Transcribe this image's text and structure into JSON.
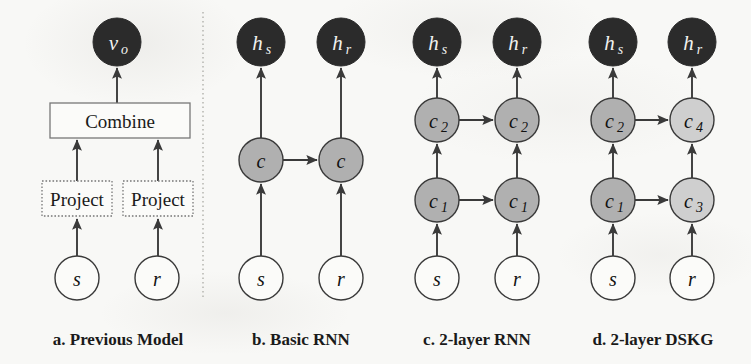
{
  "figure": {
    "background_color": "#f8f8f6",
    "divider": {
      "name": "panel-divider",
      "style": "dotted-vertical",
      "color": "#b9b9b4"
    }
  },
  "colors": {
    "node_dark": "#2b2b2b",
    "node_mid_gray": "#b0b0b0",
    "node_light_gray": "#cfcfcf",
    "node_white": "#fbfbf9",
    "stroke": "#3a3a3a",
    "box_border": "#777777",
    "text_dark": "#1a1a1a",
    "text_on_dark": "#f2f2f0"
  },
  "panels": [
    {
      "id": "panel-a",
      "caption": "a. Previous Model",
      "caption_x": 118,
      "nodes": [
        {
          "name": "node-vo",
          "label": "v",
          "sub": "o",
          "x": 117,
          "y": 42,
          "r": 24,
          "fill": "node_dark",
          "text": "light"
        },
        {
          "name": "node-s",
          "label": "s",
          "sub": "",
          "x": 77,
          "y": 278,
          "r": 22,
          "fill": "node_white",
          "text": "dark"
        },
        {
          "name": "node-r",
          "label": "r",
          "sub": "",
          "x": 157,
          "y": 278,
          "r": 22,
          "fill": "node_white",
          "text": "dark"
        }
      ],
      "boxes": [
        {
          "name": "box-combine",
          "label": "Combine",
          "x": 50,
          "y": 103,
          "w": 140,
          "h": 35,
          "border": "solid",
          "font": 19
        },
        {
          "name": "box-project-s",
          "label": "Project",
          "x": 42,
          "y": 181,
          "w": 70,
          "h": 35,
          "border": "dotted",
          "font": 17
        },
        {
          "name": "box-project-r",
          "label": "Project",
          "x": 123,
          "y": 181,
          "w": 70,
          "h": 35,
          "border": "dotted",
          "font": 17
        }
      ],
      "arrows": [
        {
          "name": "arrow-combine-to-vo",
          "x1": 117,
          "y1": 103,
          "x2": 117,
          "y2": 68
        },
        {
          "name": "arrow-project-s-to-combine",
          "x1": 77,
          "y1": 181,
          "x2": 77,
          "y2": 140
        },
        {
          "name": "arrow-project-r-to-combine",
          "x1": 158,
          "y1": 181,
          "x2": 158,
          "y2": 140
        },
        {
          "name": "arrow-s-to-project-s",
          "x1": 77,
          "y1": 256,
          "x2": 77,
          "y2": 219
        },
        {
          "name": "arrow-r-to-project-r",
          "x1": 158,
          "y1": 256,
          "x2": 158,
          "y2": 219
        }
      ]
    },
    {
      "id": "panel-b",
      "caption": "b. Basic RNN",
      "caption_x": 301,
      "nodes": [
        {
          "name": "node-hs",
          "label": "h",
          "sub": "s",
          "x": 261,
          "y": 42,
          "r": 24,
          "fill": "node_dark",
          "text": "light"
        },
        {
          "name": "node-hr",
          "label": "h",
          "sub": "r",
          "x": 341,
          "y": 42,
          "r": 24,
          "fill": "node_dark",
          "text": "light"
        },
        {
          "name": "node-c-s",
          "label": "c",
          "sub": "",
          "x": 261,
          "y": 160,
          "r": 22,
          "fill": "node_mid_gray",
          "text": "dark"
        },
        {
          "name": "node-c-r",
          "label": "c",
          "sub": "",
          "x": 341,
          "y": 160,
          "r": 22,
          "fill": "node_mid_gray",
          "text": "dark"
        },
        {
          "name": "node-s",
          "label": "s",
          "sub": "",
          "x": 261,
          "y": 278,
          "r": 22,
          "fill": "node_white",
          "text": "dark"
        },
        {
          "name": "node-r",
          "label": "r",
          "sub": "",
          "x": 341,
          "y": 278,
          "r": 22,
          "fill": "node_white",
          "text": "dark"
        }
      ],
      "boxes": [],
      "arrows": [
        {
          "name": "arrow-c-to-hs",
          "x1": 261,
          "y1": 138,
          "x2": 261,
          "y2": 68
        },
        {
          "name": "arrow-c-to-hr",
          "x1": 341,
          "y1": 138,
          "x2": 341,
          "y2": 68
        },
        {
          "name": "arrow-s-to-c",
          "x1": 261,
          "y1": 256,
          "x2": 261,
          "y2": 184
        },
        {
          "name": "arrow-r-to-c",
          "x1": 341,
          "y1": 256,
          "x2": 341,
          "y2": 184
        },
        {
          "name": "arrow-c-s-to-c-r",
          "x1": 283,
          "y1": 160,
          "x2": 317,
          "y2": 160
        }
      ]
    },
    {
      "id": "panel-c",
      "caption": "c. 2-layer RNN",
      "caption_x": 477,
      "nodes": [
        {
          "name": "node-hs",
          "label": "h",
          "sub": "s",
          "x": 437,
          "y": 42,
          "r": 24,
          "fill": "node_dark",
          "text": "light"
        },
        {
          "name": "node-hr",
          "label": "h",
          "sub": "r",
          "x": 517,
          "y": 42,
          "r": 24,
          "fill": "node_dark",
          "text": "light"
        },
        {
          "name": "node-c2-s",
          "label": "c",
          "sub": "2",
          "x": 437,
          "y": 120,
          "r": 22,
          "fill": "node_mid_gray",
          "text": "dark"
        },
        {
          "name": "node-c2-r",
          "label": "c",
          "sub": "2",
          "x": 517,
          "y": 120,
          "r": 22,
          "fill": "node_mid_gray",
          "text": "dark"
        },
        {
          "name": "node-c1-s",
          "label": "c",
          "sub": "1",
          "x": 437,
          "y": 200,
          "r": 22,
          "fill": "node_mid_gray",
          "text": "dark"
        },
        {
          "name": "node-c1-r",
          "label": "c",
          "sub": "1",
          "x": 517,
          "y": 200,
          "r": 22,
          "fill": "node_mid_gray",
          "text": "dark"
        },
        {
          "name": "node-s",
          "label": "s",
          "sub": "",
          "x": 437,
          "y": 278,
          "r": 22,
          "fill": "node_white",
          "text": "dark"
        },
        {
          "name": "node-r",
          "label": "r",
          "sub": "",
          "x": 517,
          "y": 278,
          "r": 22,
          "fill": "node_white",
          "text": "dark"
        }
      ],
      "boxes": [],
      "arrows": [
        {
          "name": "arrow-c2-to-hs",
          "x1": 437,
          "y1": 98,
          "x2": 437,
          "y2": 68
        },
        {
          "name": "arrow-c2-to-hr",
          "x1": 517,
          "y1": 98,
          "x2": 517,
          "y2": 68
        },
        {
          "name": "arrow-c1-to-c2-s",
          "x1": 437,
          "y1": 178,
          "x2": 437,
          "y2": 144
        },
        {
          "name": "arrow-c1-to-c2-r",
          "x1": 517,
          "y1": 178,
          "x2": 517,
          "y2": 144
        },
        {
          "name": "arrow-s-to-c1",
          "x1": 437,
          "y1": 256,
          "x2": 437,
          "y2": 224
        },
        {
          "name": "arrow-r-to-c1",
          "x1": 517,
          "y1": 256,
          "x2": 517,
          "y2": 224
        },
        {
          "name": "arrow-c2-s-to-c2-r",
          "x1": 459,
          "y1": 120,
          "x2": 493,
          "y2": 120
        },
        {
          "name": "arrow-c1-s-to-c1-r",
          "x1": 459,
          "y1": 200,
          "x2": 493,
          "y2": 200
        }
      ]
    },
    {
      "id": "panel-d",
      "caption": "d. 2-layer DSKG",
      "caption_x": 653,
      "nodes": [
        {
          "name": "node-hs",
          "label": "h",
          "sub": "s",
          "x": 613,
          "y": 42,
          "r": 24,
          "fill": "node_dark",
          "text": "light"
        },
        {
          "name": "node-hr",
          "label": "h",
          "sub": "r",
          "x": 692,
          "y": 42,
          "r": 24,
          "fill": "node_dark",
          "text": "light"
        },
        {
          "name": "node-c2",
          "label": "c",
          "sub": "2",
          "x": 613,
          "y": 120,
          "r": 22,
          "fill": "node_mid_gray",
          "text": "dark"
        },
        {
          "name": "node-c4",
          "label": "c",
          "sub": "4",
          "x": 692,
          "y": 120,
          "r": 22,
          "fill": "node_light_gray",
          "text": "dark"
        },
        {
          "name": "node-c1",
          "label": "c",
          "sub": "1",
          "x": 613,
          "y": 200,
          "r": 22,
          "fill": "node_mid_gray",
          "text": "dark"
        },
        {
          "name": "node-c3",
          "label": "c",
          "sub": "3",
          "x": 692,
          "y": 200,
          "r": 22,
          "fill": "node_light_gray",
          "text": "dark"
        },
        {
          "name": "node-s",
          "label": "s",
          "sub": "",
          "x": 613,
          "y": 278,
          "r": 22,
          "fill": "node_white",
          "text": "dark"
        },
        {
          "name": "node-r",
          "label": "r",
          "sub": "",
          "x": 692,
          "y": 278,
          "r": 22,
          "fill": "node_white",
          "text": "dark"
        }
      ],
      "boxes": [],
      "arrows": [
        {
          "name": "arrow-c2-to-hs",
          "x1": 613,
          "y1": 98,
          "x2": 613,
          "y2": 68
        },
        {
          "name": "arrow-c4-to-hr",
          "x1": 692,
          "y1": 98,
          "x2": 692,
          "y2": 68
        },
        {
          "name": "arrow-c1-to-c2",
          "x1": 613,
          "y1": 178,
          "x2": 613,
          "y2": 144
        },
        {
          "name": "arrow-c3-to-c4",
          "x1": 692,
          "y1": 178,
          "x2": 692,
          "y2": 144
        },
        {
          "name": "arrow-s-to-c1",
          "x1": 613,
          "y1": 256,
          "x2": 613,
          "y2": 224
        },
        {
          "name": "arrow-r-to-c3",
          "x1": 692,
          "y1": 256,
          "x2": 692,
          "y2": 224
        },
        {
          "name": "arrow-c2-to-c4",
          "x1": 635,
          "y1": 120,
          "x2": 668,
          "y2": 120
        },
        {
          "name": "arrow-c1-to-c3",
          "x1": 635,
          "y1": 200,
          "x2": 668,
          "y2": 200
        }
      ]
    }
  ],
  "caption_y": 339
}
